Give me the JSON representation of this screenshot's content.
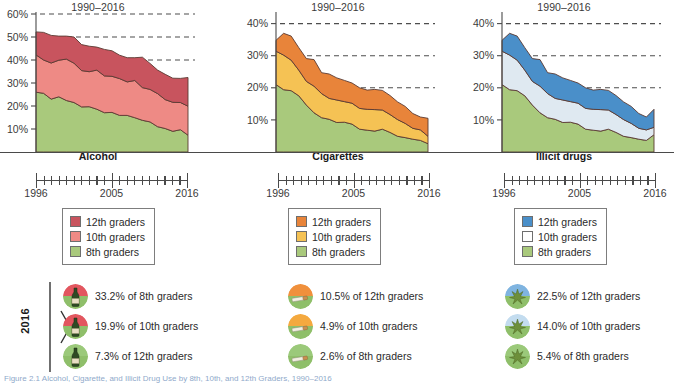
{
  "figure": {
    "caption": "Figure 2.1   Alcohol, Cigarette, and Illicit Drug Use by 8th, 10th, and 12th Graders, 1990–2016",
    "year_bracket_label": "2016",
    "range_label": "1990–2016",
    "time_axis": {
      "start_label": "1996",
      "mid_label": "2005",
      "end_label": "2016"
    }
  },
  "colors": {
    "alcohol_12th": "#C8545E",
    "alcohol_10th": "#EE8A85",
    "alcohol_8th": "#A9C97C",
    "cig_12th": "#E8843A",
    "cig_10th": "#F5C254",
    "cig_8th": "#A9C97C",
    "illicit_12th": "#4A8FC9",
    "illicit_10th": "#DFE9F1",
    "illicit_8th": "#A9C97C",
    "grid": "#4d4d4d",
    "axis": "#4a4a4a"
  },
  "chart_data": [
    {
      "type": "area",
      "title": "Alcohol",
      "subtitle": "1990–2016",
      "xlabel": "",
      "ylabel": "",
      "stacked": true,
      "grid": true,
      "legend_position": "below",
      "ylim": [
        0,
        60
      ],
      "yticks": [
        10,
        20,
        30,
        40,
        50,
        60
      ],
      "ytick_labels": [
        "10%",
        "20%",
        "30%",
        "40%",
        "50%",
        "60%"
      ],
      "gridlines": [
        40,
        50,
        60
      ],
      "x": [
        1996,
        1997,
        1998,
        1999,
        2000,
        2001,
        2002,
        2003,
        2004,
        2005,
        2006,
        2007,
        2008,
        2009,
        2010,
        2011,
        2012,
        2013,
        2014,
        2015,
        2016
      ],
      "series": [
        {
          "name": "8th graders",
          "values": [
            26.0,
            25.5,
            23.0,
            24.0,
            22.4,
            21.5,
            19.6,
            19.7,
            18.6,
            17.1,
            17.2,
            15.9,
            15.9,
            14.9,
            13.8,
            13.1,
            11.0,
            10.2,
            9.0,
            9.7,
            7.3
          ]
        },
        {
          "name": "10th graders",
          "values": [
            16.2,
            14.5,
            15.7,
            15.9,
            18.0,
            17.1,
            15.8,
            15.2,
            17.0,
            16.0,
            15.7,
            16.0,
            14.6,
            16.2,
            14.2,
            14.1,
            14.4,
            12.6,
            12.6,
            11.8,
            12.6
          ]
        },
        {
          "name": "12th graders",
          "values": [
            10.0,
            12.0,
            12.0,
            10.5,
            10.0,
            11.4,
            11.3,
            11.1,
            10.0,
            11.5,
            11.1,
            10.2,
            10.5,
            9.9,
            13.2,
            11.3,
            10.2,
            11.0,
            10.5,
            10.5,
            12.5
          ]
        }
      ]
    },
    {
      "type": "area",
      "title": "Cigarettes",
      "subtitle": "1990–2016",
      "xlabel": "",
      "ylabel": "",
      "stacked": true,
      "grid": true,
      "legend_position": "below",
      "ylim": [
        0,
        43
      ],
      "yticks": [
        10,
        20,
        30,
        40
      ],
      "ytick_labels": [
        "10%",
        "20%",
        "30%",
        "40%"
      ],
      "gridlines": [
        20,
        30,
        40
      ],
      "x": [
        1996,
        1997,
        1998,
        1999,
        2000,
        2001,
        2002,
        2003,
        2004,
        2005,
        2006,
        2007,
        2008,
        2009,
        2010,
        2011,
        2012,
        2013,
        2014,
        2015,
        2016
      ],
      "series": [
        {
          "name": "8th graders",
          "values": [
            21.0,
            19.4,
            19.1,
            17.5,
            14.6,
            12.2,
            10.7,
            10.2,
            9.2,
            9.3,
            8.7,
            7.1,
            6.8,
            6.5,
            7.1,
            6.1,
            4.9,
            4.5,
            4.0,
            3.6,
            2.6
          ]
        },
        {
          "name": "10th graders",
          "values": [
            10.4,
            10.8,
            9.5,
            8.0,
            7.4,
            8.3,
            7.5,
            6.5,
            7.0,
            6.4,
            6.5,
            6.5,
            6.5,
            6.7,
            6.0,
            5.6,
            5.2,
            4.4,
            3.4,
            3.3,
            2.3
          ]
        },
        {
          "name": "12th graders",
          "values": [
            3.4,
            6.8,
            7.5,
            7.0,
            7.1,
            8.3,
            6.5,
            7.6,
            6.9,
            6.6,
            6.3,
            6.4,
            6.0,
            6.3,
            6.1,
            5.9,
            5.5,
            5.3,
            4.6,
            4.0,
            5.6
          ]
        }
      ]
    },
    {
      "type": "area",
      "title": "Illicit drugs",
      "subtitle": "1990–2016",
      "xlabel": "",
      "ylabel": "",
      "stacked": true,
      "grid": true,
      "legend_position": "below",
      "ylim": [
        0,
        43
      ],
      "yticks": [
        10,
        20,
        30,
        40
      ],
      "ytick_labels": [
        "10%",
        "20%",
        "30%",
        "40%"
      ],
      "gridlines": [
        20,
        30,
        40
      ],
      "x": [
        1996,
        1997,
        1998,
        1999,
        2000,
        2001,
        2002,
        2003,
        2004,
        2005,
        2006,
        2007,
        2008,
        2009,
        2010,
        2011,
        2012,
        2013,
        2014,
        2015,
        2016
      ],
      "series": [
        {
          "name": "8th graders",
          "values": [
            21.0,
            19.4,
            19.1,
            17.5,
            14.6,
            12.2,
            10.7,
            10.2,
            9.2,
            9.3,
            8.7,
            7.1,
            6.8,
            6.5,
            7.1,
            6.1,
            4.9,
            4.5,
            4.0,
            3.6,
            5.4
          ]
        },
        {
          "name": "10th graders",
          "values": [
            10.4,
            10.8,
            9.5,
            8.0,
            7.4,
            8.3,
            7.5,
            6.5,
            7.0,
            6.4,
            6.5,
            6.5,
            6.5,
            6.7,
            6.0,
            5.6,
            5.2,
            4.4,
            3.4,
            3.3,
            2.3
          ]
        },
        {
          "name": "12th graders",
          "values": [
            3.4,
            6.8,
            7.5,
            7.0,
            7.1,
            8.3,
            6.5,
            7.6,
            6.9,
            6.6,
            6.3,
            6.4,
            6.0,
            6.3,
            6.1,
            5.9,
            5.5,
            5.3,
            4.6,
            4.0,
            5.6
          ]
        }
      ]
    }
  ],
  "legends": [
    {
      "name": "alcohol",
      "items": [
        {
          "label": "12th graders",
          "color": "#C8545E"
        },
        {
          "label": "10th graders",
          "color": "#EE8A85"
        },
        {
          "label": "8th graders",
          "color": "#A9C97C"
        }
      ]
    },
    {
      "name": "cigarettes",
      "items": [
        {
          "label": "12th graders",
          "color": "#E8843A"
        },
        {
          "label": "10th graders",
          "color": "#F5C254"
        },
        {
          "label": "8th graders",
          "color": "#A9C97C"
        }
      ]
    },
    {
      "name": "illicit-drugs",
      "items": [
        {
          "label": "12th graders",
          "color": "#4A8FC9"
        },
        {
          "label": "10th graders",
          "color": "#FFFFFF"
        },
        {
          "label": "8th graders",
          "color": "#A9C97C"
        }
      ]
    }
  ],
  "stats": [
    {
      "name": "alcohol",
      "icon": "bottle-icon",
      "rows": [
        {
          "text": "33.2% of 8th graders",
          "top": "#E2565F",
          "bottom": "#8FBF6A"
        },
        {
          "text": "19.9% of 10th graders",
          "top": "#E2565F",
          "bottom": "#8FBF6A"
        },
        {
          "text": "7.3% of 12th graders",
          "top": "#9BC97A",
          "bottom": "#8FBF6A"
        }
      ]
    },
    {
      "name": "cigarettes",
      "icon": "cigarette-icon",
      "rows": [
        {
          "text": "10.5% of 12th graders",
          "top": "#F0903C",
          "bottom": "#8FBF6A"
        },
        {
          "text": "4.9% of 10th graders",
          "top": "#F4A93F",
          "bottom": "#8FBF6A"
        },
        {
          "text": "2.6% of 8th graders",
          "top": "#9BC97A",
          "bottom": "#8FBF6A"
        }
      ]
    },
    {
      "name": "illicit-drugs",
      "icon": "cannabis-leaf-icon",
      "rows": [
        {
          "text": "22.5% of 12th graders",
          "top": "#7FB4E0",
          "bottom": "#8FBF6A"
        },
        {
          "text": "14.0% of 10th graders",
          "top": "#C3DCEF",
          "bottom": "#8FBF6A"
        },
        {
          "text": "5.4% of 8th graders",
          "top": "#9BC97A",
          "bottom": "#8FBF6A"
        }
      ]
    }
  ]
}
